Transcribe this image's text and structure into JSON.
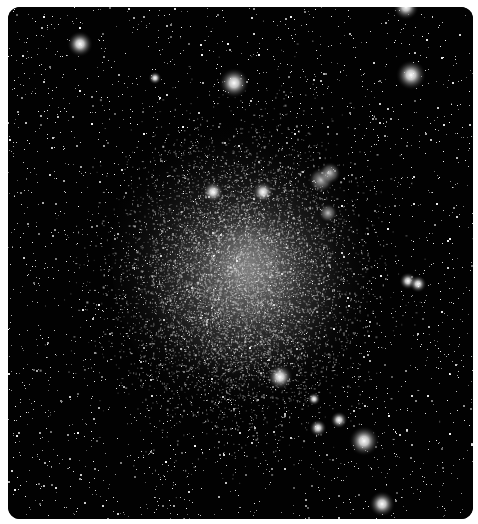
{
  "image": {
    "subject": "dwarf irregular galaxy in a dense starfield",
    "description": "Grayscale astronomical photograph of a diffuse, cloud-like dwarf galaxy surrounded by many field stars, with a small double nebula to the upper right of the galaxy",
    "colors": {
      "background": "#020202",
      "frame": "#ffffff",
      "galaxy_glow": "#d8d8d8",
      "stars": "#ffffff"
    },
    "features": [
      {
        "name": "galaxy-body",
        "kind": "diffuse glow"
      },
      {
        "name": "double-nebula",
        "kind": "emission nebula pair"
      },
      {
        "name": "field-stars",
        "kind": "point sources"
      }
    ]
  }
}
